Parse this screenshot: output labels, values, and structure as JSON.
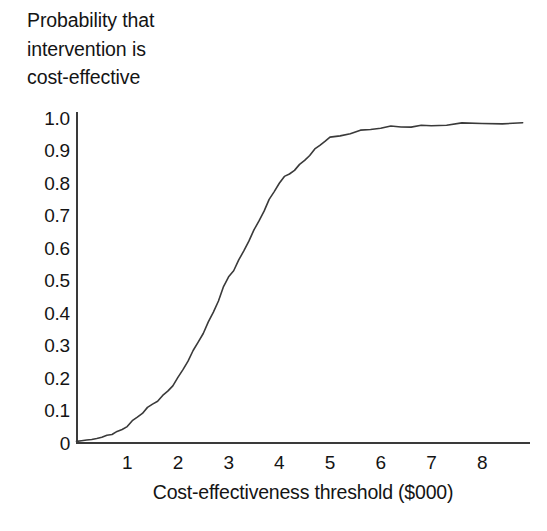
{
  "figure": {
    "title_lines": [
      "Probability that",
      "intervention is",
      "cost-effective"
    ],
    "background_color": "#ffffff",
    "line_color": "#3a3a3a",
    "text_color": "#141414"
  },
  "chart_data": {
    "type": "line",
    "xlabel": "Cost-effectiveness threshold ($000)",
    "ylabel": "Probability that intervention is cost-effective",
    "xlim": [
      0,
      8.9
    ],
    "ylim": [
      0,
      1.0
    ],
    "grid": false,
    "legend": "none",
    "xticks": [
      "1",
      "2",
      "3",
      "4",
      "5",
      "6",
      "7",
      "8"
    ],
    "xtick_values": [
      1,
      2,
      3,
      4,
      5,
      6,
      7,
      8
    ],
    "yticks": [
      "0",
      "0.1",
      "0.2",
      "0.3",
      "0.4",
      "0.5",
      "0.6",
      "0.7",
      "0.8",
      "0.9",
      "1.0"
    ],
    "ytick_values": [
      0,
      0.1,
      0.2,
      0.3,
      0.4,
      0.5,
      0.6,
      0.7,
      0.8,
      0.9,
      1.0
    ],
    "series": [
      {
        "name": "Cost-effectiveness acceptability curve",
        "x": [
          0.0,
          0.1,
          0.2,
          0.3,
          0.4,
          0.5,
          0.6,
          0.7,
          0.8,
          0.9,
          1.0,
          1.1,
          1.2,
          1.3,
          1.4,
          1.5,
          1.6,
          1.7,
          1.8,
          1.9,
          2.0,
          2.1,
          2.2,
          2.3,
          2.4,
          2.5,
          2.6,
          2.7,
          2.8,
          2.9,
          3.0,
          3.1,
          3.2,
          3.3,
          3.4,
          3.5,
          3.6,
          3.7,
          3.8,
          3.9,
          4.0,
          4.1,
          4.2,
          4.3,
          4.4,
          4.5,
          4.6,
          4.7,
          4.8,
          4.9,
          5.0,
          5.2,
          5.4,
          5.6,
          5.8,
          6.0,
          6.2,
          6.4,
          6.6,
          6.8,
          7.0,
          7.3,
          7.6,
          8.0,
          8.4,
          8.8
        ],
        "y": [
          0.005,
          0.007,
          0.009,
          0.011,
          0.014,
          0.018,
          0.022,
          0.027,
          0.033,
          0.043,
          0.055,
          0.068,
          0.08,
          0.092,
          0.105,
          0.118,
          0.13,
          0.145,
          0.162,
          0.18,
          0.2,
          0.225,
          0.252,
          0.28,
          0.31,
          0.34,
          0.372,
          0.405,
          0.44,
          0.478,
          0.51,
          0.53,
          0.56,
          0.592,
          0.625,
          0.655,
          0.685,
          0.715,
          0.745,
          0.772,
          0.8,
          0.818,
          0.83,
          0.843,
          0.856,
          0.87,
          0.885,
          0.9,
          0.915,
          0.93,
          0.94,
          0.948,
          0.955,
          0.96,
          0.964,
          0.968,
          0.971,
          0.973,
          0.975,
          0.977,
          0.979,
          0.98,
          0.981,
          0.982,
          0.982,
          0.982
        ]
      }
    ],
    "annotations": []
  }
}
